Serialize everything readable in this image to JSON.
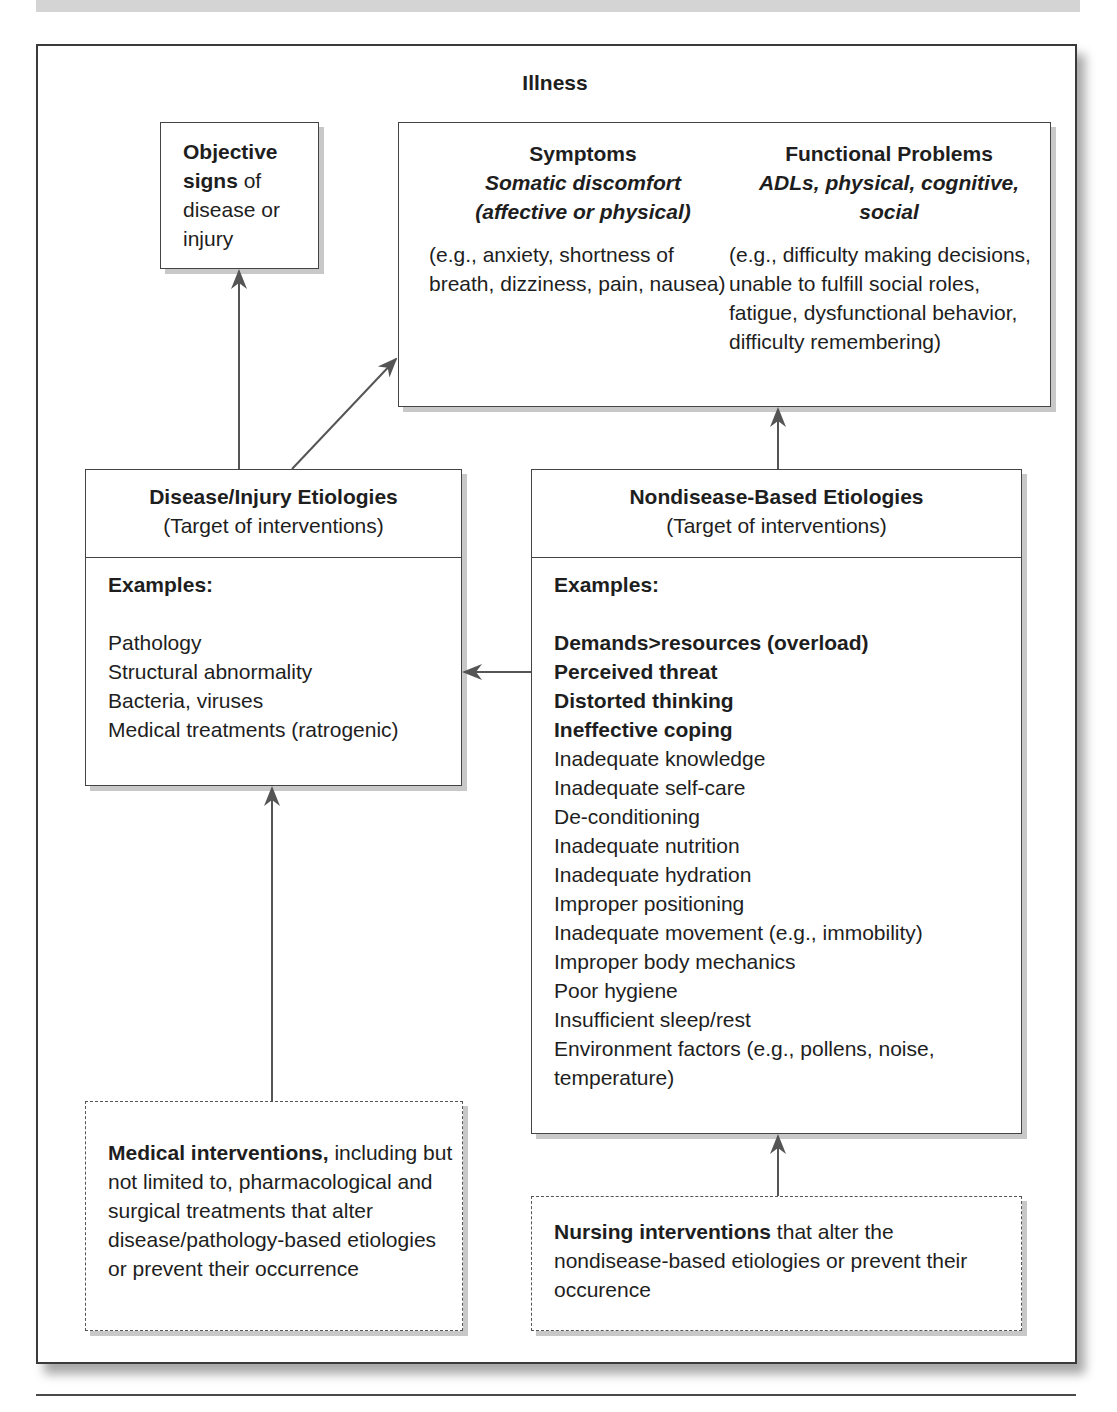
{
  "diagram": {
    "title": "Illness",
    "objective_signs": {
      "bold_part": "Objective signs",
      "rest": " of disease or injury"
    },
    "symptoms": {
      "title": "Symptoms",
      "subtitle_line1": "Somatic discomfort",
      "subtitle_line2": "(affective or physical)",
      "examples": "(e.g., anxiety, shortness of breath, dizziness, pain, nausea)"
    },
    "functional_problems": {
      "title": "Functional Problems",
      "subtitle": "ADLs, physical, cognitive, social",
      "examples": "(e.g., difficulty making decisions, unable to fulfill social roles, fatigue, dysfunctional behavior, difficulty remembering)"
    },
    "disease_etiologies": {
      "title": "Disease/Injury Etiologies",
      "subtitle": "(Target of interventions)",
      "examples_label": "Examples:",
      "items": [
        "Pathology",
        "Structural abnormality",
        "Bacteria, viruses",
        "Medical treatments (ratrogenic)"
      ]
    },
    "nondisease_etiologies": {
      "title": "Nondisease-Based Etiologies",
      "subtitle": "(Target of interventions)",
      "examples_label": "Examples:",
      "bold_items": [
        "Demands>resources (overload)",
        "Perceived threat",
        "Distorted thinking",
        "Ineffective coping"
      ],
      "items": [
        "Inadequate knowledge",
        "Inadequate self-care",
        "De-conditioning",
        "Inadequate nutrition",
        "Inadequate hydration",
        "Improper positioning",
        "Inadequate movement (e.g., immobility)",
        "Improper body mechanics",
        "Poor hygiene",
        "Insufficient sleep/rest",
        "Environment factors (e.g., pollens, noise, temperature)"
      ]
    },
    "medical_interventions": {
      "bold_part": "Medical interventions,",
      "rest": " including but not limited to, pharmacological and surgical treatments that alter disease/pathology-based etiologies or prevent their occurrence"
    },
    "nursing_interventions": {
      "bold_part": "Nursing interventions",
      "rest": " that alter the nondisease-based etiologies or prevent their occurence"
    },
    "colors": {
      "line": "#555555",
      "shadow": "#c8c8c8",
      "banner": "#d4d4d4"
    }
  }
}
